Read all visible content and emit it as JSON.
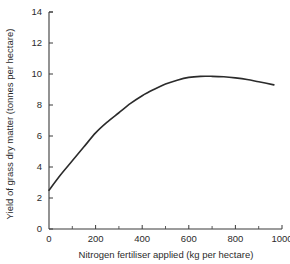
{
  "chart_data": {
    "type": "line",
    "title": "",
    "xlabel": "Nitrogen fertiliser applied (kg per hectare)",
    "ylabel": "Yield of grass dry matter (tonnes per hectare)",
    "xlim": [
      0,
      1000
    ],
    "ylim": [
      0,
      14
    ],
    "xticks": [
      0,
      200,
      400,
      600,
      800,
      1000
    ],
    "xtick_labels": [
      "0",
      "200",
      "400",
      "600",
      "800",
      "1000"
    ],
    "x_minor_ticks": [
      100,
      300,
      500,
      700,
      900
    ],
    "yticks": [
      0,
      2,
      4,
      6,
      8,
      10,
      12,
      14
    ],
    "ytick_labels": [
      "0",
      "2",
      "4",
      "6",
      "8",
      "10",
      "12",
      "14"
    ],
    "grid": false,
    "legend": false,
    "series": [
      {
        "name": "Grass dry matter yield",
        "color": "#2b2b2b",
        "x": [
          0,
          50,
          100,
          150,
          200,
          250,
          300,
          350,
          400,
          450,
          500,
          550,
          600,
          650,
          700,
          750,
          800,
          850,
          900,
          965
        ],
        "y": [
          2.5,
          3.5,
          4.4,
          5.3,
          6.2,
          6.9,
          7.5,
          8.1,
          8.6,
          9.0,
          9.35,
          9.6,
          9.78,
          9.85,
          9.85,
          9.82,
          9.75,
          9.65,
          9.5,
          9.3
        ]
      }
    ]
  },
  "axes": {
    "x_axis_name": "x-axis",
    "y_axis_name": "y-axis"
  }
}
